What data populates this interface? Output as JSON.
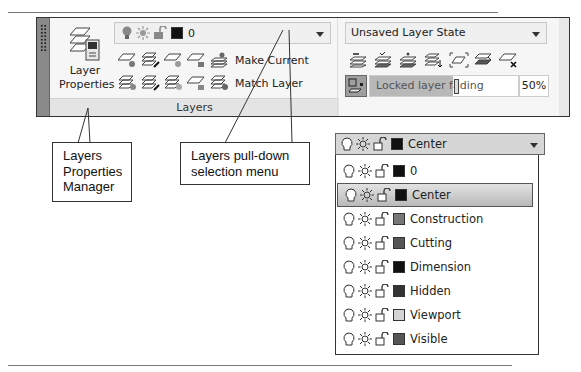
{
  "ribbon": {
    "layer_properties_label_1": "Layer",
    "layer_properties_label_2": "Properties",
    "current_layer": {
      "name": "0",
      "color": "#111111"
    },
    "tools_row1": [
      "layer-off-icon",
      "layer-isolate-icon",
      "layer-freeze-icon",
      "layer-lock-icon"
    ],
    "tools_row2": [
      "layer-on-icon",
      "layer-unisolate-icon",
      "layer-thaw-icon",
      "layer-unlock-icon"
    ],
    "make_current_label": "Make Current",
    "match_layer_label": "Match Layer",
    "panel_title": "Layers",
    "layer_state": "Unsaved Layer State",
    "state_tools": [
      "layer-previous-icon",
      "layer-walk-icon",
      "layer-merge-icon",
      "change-to-current-icon",
      "copy-objects-icon",
      "layer-walk-frame-icon",
      "layer-delete-icon"
    ],
    "fading_label": "Locked layer fading",
    "fading_percent": "50%"
  },
  "callouts": {
    "manager": [
      "Layers",
      "Properties",
      "Manager"
    ],
    "pulldown": [
      "Layers pull-down",
      "selection menu"
    ]
  },
  "dropdown": {
    "selected": {
      "name": "Center",
      "color": "#111111"
    },
    "items": [
      {
        "name": "0",
        "color": "#111111"
      },
      {
        "name": "Center",
        "color": "#111111",
        "selected": true
      },
      {
        "name": "Construction",
        "color": "#777777"
      },
      {
        "name": "Cutting",
        "color": "#555555"
      },
      {
        "name": "Dimension",
        "color": "#111111"
      },
      {
        "name": "Hidden",
        "color": "#333333"
      },
      {
        "name": "Viewport",
        "color": "#d4d4d4"
      },
      {
        "name": "Visible",
        "color": "#555555"
      }
    ]
  }
}
